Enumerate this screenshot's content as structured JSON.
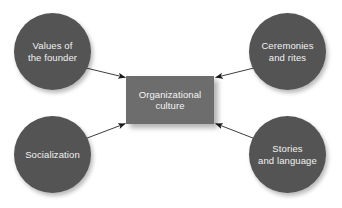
{
  "diagram": {
    "type": "hub-and-spoke",
    "background_color": "#ffffff",
    "circle_color": "#545454",
    "box_color": "#6d6d6d",
    "text_color": "#f2f2f2",
    "arrow_color": "#1a1a1a",
    "center": {
      "label": "Organizational\nculture",
      "shape": "rectangle"
    },
    "nodes": [
      {
        "id": "values-of-the-founder",
        "label": "Values of\nthe founder",
        "position": "top-left",
        "shape": "circle"
      },
      {
        "id": "ceremonies-and-rites",
        "label": "Ceremonies\nand rites",
        "position": "top-right",
        "shape": "circle"
      },
      {
        "id": "socialization",
        "label": "Socialization",
        "position": "bottom-left",
        "shape": "circle"
      },
      {
        "id": "stories-and-language",
        "label": "Stories\nand language",
        "position": "bottom-right",
        "shape": "circle"
      }
    ],
    "arrows": [
      {
        "id": "arrow-values-to-center",
        "from": "values-of-the-founder",
        "to": "center",
        "direction": "inward"
      },
      {
        "id": "arrow-ceremonies-to-center",
        "from": "ceremonies-and-rites",
        "to": "center",
        "direction": "inward"
      },
      {
        "id": "arrow-socialization-to-center",
        "from": "socialization",
        "to": "center",
        "direction": "inward"
      },
      {
        "id": "arrow-stories-to-center",
        "from": "stories-and-language",
        "to": "center",
        "direction": "inward"
      }
    ]
  }
}
